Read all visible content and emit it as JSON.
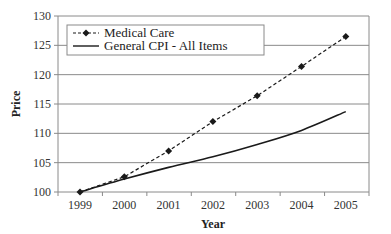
{
  "chart_data": {
    "type": "line",
    "title": "",
    "xlabel": "Year",
    "ylabel": "Price",
    "x": [
      "1999",
      "2000",
      "2001",
      "2002",
      "2003",
      "2004",
      "2005"
    ],
    "ylim": [
      100,
      130
    ],
    "yticks": [
      100,
      105,
      110,
      115,
      120,
      125,
      130
    ],
    "grid": true,
    "legend_position": "upper left",
    "series": [
      {
        "name": "Medical Care",
        "style": "dashed-with-diamond-markers",
        "values": [
          100,
          102.6,
          107,
          112,
          116.4,
          121.4,
          126.5
        ]
      },
      {
        "name": "General CPI - All Items",
        "style": "solid",
        "values": [
          100,
          102.2,
          104.2,
          106,
          108.1,
          110.5,
          113.7
        ]
      }
    ]
  },
  "colors": {
    "grid": "#8a8a8a",
    "axis": "#8a8a8a",
    "line": "#1a1a1a"
  }
}
